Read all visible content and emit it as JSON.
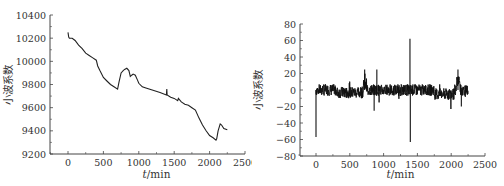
{
  "chart_data": [
    {
      "type": "line",
      "title": "",
      "xlabel": "t/min",
      "ylabel": "小波系数",
      "xlim": [
        -300,
        2500
      ],
      "ylim": [
        9200,
        10400
      ],
      "xticks": [
        0,
        500,
        1000,
        1500,
        2000,
        2500
      ],
      "yticks": [
        9200,
        9400,
        9600,
        9800,
        10000,
        10200,
        10400
      ],
      "grid": false,
      "legend": null,
      "series": [
        {
          "name": "wavelet-approximation",
          "x": [
            0,
            10,
            20,
            60,
            100,
            150,
            200,
            250,
            300,
            350,
            400,
            420,
            450,
            500,
            550,
            600,
            650,
            700,
            720,
            750,
            780,
            800,
            830,
            860,
            880,
            900,
            920,
            950,
            980,
            1000,
            1050,
            1100,
            1200,
            1300,
            1390,
            1395,
            1400,
            1450,
            1500,
            1550,
            1560,
            1600,
            1650,
            1700,
            1750,
            1800,
            1850,
            1900,
            1950,
            2000,
            2050,
            2090,
            2100,
            2120,
            2150,
            2170,
            2200,
            2250
          ],
          "y": [
            10250,
            10210,
            10200,
            10200,
            10180,
            10140,
            10110,
            10070,
            10050,
            10030,
            10010,
            9960,
            9920,
            9860,
            9830,
            9800,
            9780,
            9760,
            9820,
            9900,
            9920,
            9930,
            9940,
            9920,
            9870,
            9880,
            9890,
            9880,
            9840,
            9810,
            9780,
            9770,
            9750,
            9730,
            9710,
            9760,
            9710,
            9690,
            9680,
            9660,
            9680,
            9650,
            9630,
            9620,
            9600,
            9580,
            9510,
            9450,
            9400,
            9360,
            9340,
            9320,
            9330,
            9400,
            9460,
            9450,
            9420,
            9410
          ]
        }
      ]
    },
    {
      "type": "line",
      "title": "",
      "xlabel": "t/min",
      "ylabel": "小波系数",
      "xlim": [
        -300,
        2500
      ],
      "ylim": [
        -80,
        80
      ],
      "xticks": [
        0,
        500,
        1000,
        1500,
        2000,
        2500
      ],
      "yticks": [
        -80,
        -60,
        -40,
        -20,
        0,
        20,
        40,
        60,
        80
      ],
      "grid": false,
      "legend": null,
      "series": [
        {
          "name": "wavelet-detail",
          "description": "noisy signal around 0 (approx ±10), spikes: -57 near t=0, +25 near t=720, +25 near t=900, -25 near t=860, +62/-63 near t=1390, +25 near t=2100, -20 near t=2150",
          "x": [
            0,
            5,
            10,
            150,
            300,
            500,
            700,
            720,
            760,
            800,
            860,
            900,
            920,
            1000,
            1200,
            1385,
            1390,
            1395,
            1400,
            1600,
            1800,
            2000,
            2090,
            2100,
            2130,
            2150,
            2200,
            2250
          ],
          "y": [
            -57,
            8,
            -5,
            10,
            -8,
            -5,
            0,
            25,
            10,
            -18,
            -25,
            25,
            -10,
            5,
            0,
            5,
            62,
            -63,
            0,
            8,
            -15,
            -5,
            10,
            25,
            5,
            -20,
            10,
            0
          ]
        }
      ]
    }
  ]
}
